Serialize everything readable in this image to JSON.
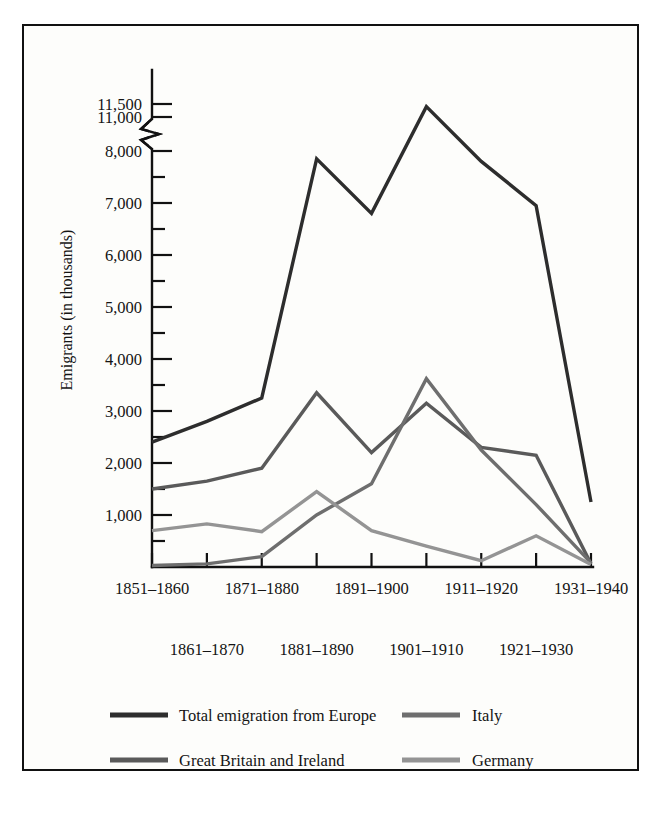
{
  "chart_data": {
    "type": "line",
    "title": "",
    "xlabel": "",
    "ylabel": "Emigrants (in thousands)",
    "grid": false,
    "legend_position": "bottom",
    "axis_break": {
      "present": true,
      "between": [
        8000,
        11000
      ]
    },
    "ylim": [
      0,
      11500
    ],
    "y_ticks_major": [
      1000,
      2000,
      3000,
      4000,
      5000,
      6000,
      7000,
      8000,
      11000,
      11500
    ],
    "y_tick_labels": [
      "1,000",
      "2,000",
      "3,000",
      "4,000",
      "5,000",
      "6,000",
      "7,000",
      "8,000",
      "11,000",
      "11,500"
    ],
    "y_ticks_minor": [
      500,
      1500,
      2500,
      3500,
      4500,
      5500,
      6500,
      7500
    ],
    "categories": [
      "1851–1860",
      "1861–1870",
      "1871–1880",
      "1881–1890",
      "1891–1900",
      "1901–1910",
      "1911–1920",
      "1921–1930",
      "1931–1940"
    ],
    "x_labels_top_row": [
      "1851–1860",
      "1871–1880",
      "1891–1900",
      "1911–1920",
      "1931–1940"
    ],
    "x_labels_bottom_row": [
      "1861–1870",
      "1881–1890",
      "1901–1910",
      "1921–1930"
    ],
    "series": [
      {
        "name": "Total emigration from Europe",
        "color": "#2d2d2d",
        "width": 3.4,
        "values": [
          2400,
          2800,
          3250,
          7850,
          6800,
          11400,
          7800,
          6950,
          1250
        ]
      },
      {
        "name": "Great Britain and Ireland",
        "color": "#5a5a5a",
        "width": 3.4,
        "values": [
          1500,
          1650,
          1900,
          3350,
          2200,
          3150,
          2300,
          2150,
          60
        ]
      },
      {
        "name": "Italy",
        "color": "#6e6e6e",
        "width": 3.4,
        "values": [
          30,
          60,
          200,
          1000,
          1600,
          3620,
          2250,
          1200,
          80
        ]
      },
      {
        "name": "Germany",
        "color": "#949494",
        "width": 3.4,
        "values": [
          700,
          830,
          680,
          1450,
          700,
          400,
          120,
          600,
          50
        ]
      }
    ]
  },
  "legend": {
    "entries": [
      {
        "label": "Total emigration from Europe",
        "color": "#2d2d2d"
      },
      {
        "label": "Italy",
        "color": "#6e6e6e"
      },
      {
        "label": "Great Britain and Ireland",
        "color": "#5a5a5a"
      },
      {
        "label": "Germany",
        "color": "#949494"
      }
    ]
  }
}
